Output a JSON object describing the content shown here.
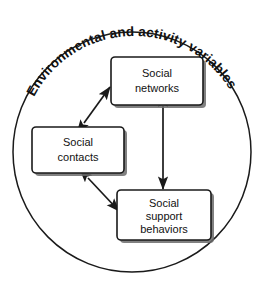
{
  "figure": {
    "type": "conceptual-diagram",
    "outer_label": "Environmental and activity variables",
    "background_color": "#ffffff",
    "line_color": "#1a1a1a"
  },
  "nodes": [
    {
      "id": "social-networks",
      "lines": [
        "Social",
        "networks"
      ],
      "line1": "Social",
      "line2": "networks",
      "line3": ""
    },
    {
      "id": "social-contacts",
      "lines": [
        "Social",
        "contacts"
      ],
      "line1": "Social",
      "line2": "contacts",
      "line3": ""
    },
    {
      "id": "social-support-behaviors",
      "lines": [
        "Social",
        "support",
        "behaviors"
      ],
      "line1": "Social",
      "line2": "support",
      "line3": "behaviors"
    }
  ],
  "edges": [
    {
      "id": "contacts-networks",
      "from": "social-contacts",
      "to": "social-networks",
      "arrowheads": "both"
    },
    {
      "id": "contacts-support",
      "from": "social-contacts",
      "to": "social-support-behaviors",
      "arrowheads": "both"
    },
    {
      "id": "networks-support",
      "from": "social-networks",
      "to": "social-support-behaviors",
      "arrowheads": "both"
    }
  ]
}
